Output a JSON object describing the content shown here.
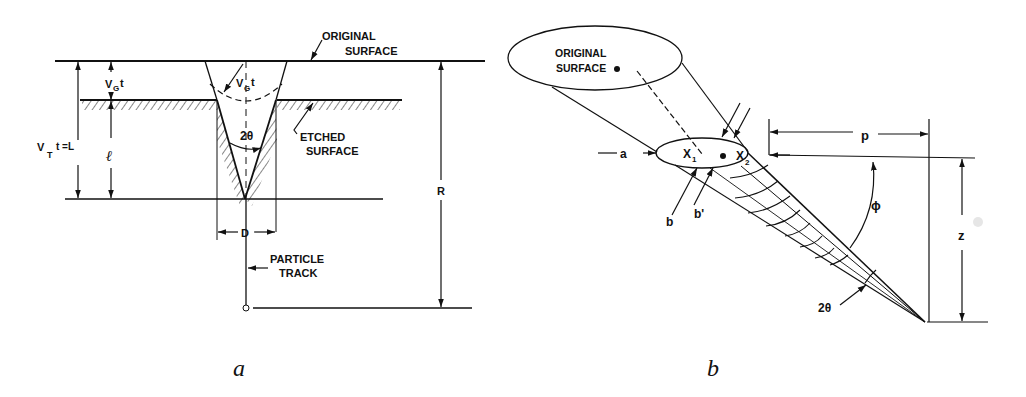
{
  "figure_a": {
    "caption": "a",
    "labels": {
      "original_surface_1": "ORIGINAL",
      "original_surface_2": "SURFACE",
      "etched_surface_1": "ETCHED",
      "etched_surface_2": "SURFACE",
      "vg_t_left": "V",
      "vg_sub": "G",
      "t": "t",
      "vt_t": "V",
      "vt_sub": "T",
      "vt_rest": "t =L",
      "l": "ℓ",
      "two_theta": "2θ",
      "d": "D",
      "r": "R",
      "particle_1": "PARTICLE",
      "particle_2": "TRACK"
    }
  },
  "figure_b": {
    "caption": "b",
    "labels": {
      "original_surface_1": "ORIGINAL",
      "original_surface_2": "SURFACE",
      "a": "a",
      "x1": "X",
      "x1_sub": "1",
      "x2": "X",
      "x2_sub": "2",
      "b": "b",
      "b_prime": "b'",
      "p": "p",
      "phi": "ϕ",
      "z": "z",
      "two_theta": "2θ"
    }
  }
}
